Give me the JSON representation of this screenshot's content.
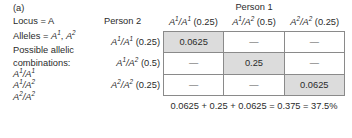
{
  "figure": {
    "panel_label": "(a)",
    "left_column": {
      "locus_line": "Locus = A",
      "alleles_label": "Alleles = ",
      "alleles_values": [
        "A1",
        "A2"
      ],
      "possible_label_line1": "Possible allelic",
      "possible_label_line2": "combinations:",
      "combinations": [
        {
          "left": "A1",
          "right": "A1"
        },
        {
          "left": "A1",
          "right": "A2"
        },
        {
          "left": "A2",
          "right": "A2"
        }
      ]
    },
    "person1_header": "Person 1",
    "person2_header": "Person 2",
    "column_headers": [
      {
        "genotype_left": "A1",
        "genotype_right": "A1",
        "probability": "(0.25)"
      },
      {
        "genotype_left": "A1",
        "genotype_right": "A2",
        "probability": "(0.5)"
      },
      {
        "genotype_left": "A2",
        "genotype_right": "A2",
        "probability": "(0.25)"
      }
    ],
    "row_headers": [
      {
        "genotype_left": "A1",
        "genotype_right": "A1",
        "probability": "(0.25)"
      },
      {
        "genotype_left": "A1",
        "genotype_right": "A2",
        "probability": "(0.5)"
      },
      {
        "genotype_left": "A2",
        "genotype_right": "A2",
        "probability": "(0.25)"
      }
    ],
    "matrix": [
      [
        {
          "value": "0.0625",
          "shaded": true
        },
        {
          "value": "—",
          "shaded": false
        },
        {
          "value": "—",
          "shaded": false
        }
      ],
      [
        {
          "value": "—",
          "shaded": false
        },
        {
          "value": "0.25",
          "shaded": true
        },
        {
          "value": "—",
          "shaded": false
        }
      ],
      [
        {
          "value": "—",
          "shaded": false
        },
        {
          "value": "—",
          "shaded": false
        },
        {
          "value": "0.0625",
          "shaded": true
        }
      ]
    ],
    "summation": "0.0625 + 0.25 + 0.0625 = 0.375 = 37.5%",
    "colors": {
      "shaded_cell": "#dcdcdc",
      "border": "#8a8a8a",
      "text": "#2b2b2b",
      "background": "#ffffff"
    }
  }
}
